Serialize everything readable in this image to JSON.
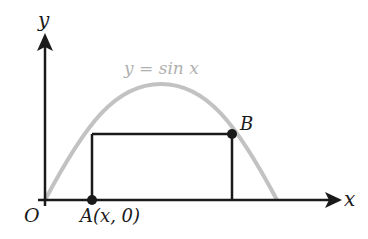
{
  "diagram": {
    "curve_label": "y = sin x",
    "axis_x_label": "x",
    "axis_y_label": "y",
    "origin_label": "O",
    "point_a_label": "A(x, 0)",
    "point_b_label": "B",
    "colors": {
      "curve": "#c2c2c2",
      "axes": "#1a1a1a",
      "rectangle": "#1a1a1a",
      "curve_label": "#b0b0b0"
    }
  }
}
